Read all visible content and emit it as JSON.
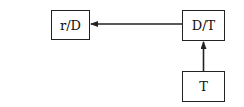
{
  "diagram": {
    "nodes": [
      {
        "id": "rD",
        "label": "r/D"
      },
      {
        "id": "DT",
        "label": "D/T"
      },
      {
        "id": "T",
        "label": "T"
      }
    ],
    "edges": [
      {
        "from": "DT",
        "to": "rD",
        "direction": "left"
      },
      {
        "from": "T",
        "to": "DT",
        "direction": "up"
      }
    ],
    "colors": {
      "line": "#222222",
      "background": "#ffffff"
    }
  }
}
